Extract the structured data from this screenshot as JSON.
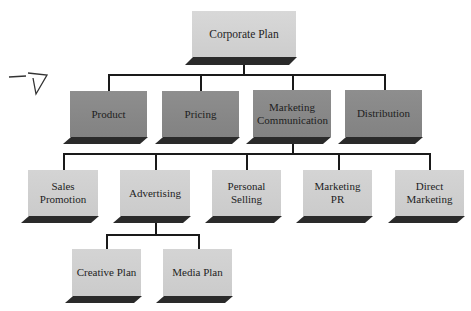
{
  "diagram": {
    "type": "org-chart",
    "root": {
      "label": "Corporate Plan"
    },
    "level1": [
      {
        "label": "Product"
      },
      {
        "label": "Pricing"
      },
      {
        "label": "Marketing Communication"
      },
      {
        "label": "Distribution"
      }
    ],
    "level2_parent": "Marketing Communication",
    "level2": [
      {
        "label": "Sales Promotion"
      },
      {
        "label": "Advertising"
      },
      {
        "label": "Personal Selling"
      },
      {
        "label": "Marketing PR"
      },
      {
        "label": "Direct Marketing"
      }
    ],
    "level3_parent": "Advertising",
    "level3": [
      {
        "label": "Creative Plan"
      },
      {
        "label": "Media Plan"
      }
    ],
    "colors": {
      "root_fill": "#d2d2d2",
      "level1_fill": "#888888",
      "level2_fill": "#cfcfcf",
      "shadow": "#2a2a2a",
      "connector": "#1a1a1a"
    }
  }
}
